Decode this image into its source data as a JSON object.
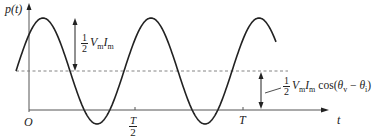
{
  "figure": {
    "y_axis_label": "p(t)",
    "x_axis_label": "t",
    "origin_label": "O",
    "ticks": [
      {
        "label_num": "T",
        "label_den": "2",
        "position": "half-period"
      },
      {
        "label": "T",
        "position": "period"
      }
    ],
    "amplitude_annotation": {
      "coefficient_num": "1",
      "coefficient_den": "2",
      "V": "V",
      "V_sub": "m",
      "I": "I",
      "I_sub": "m"
    },
    "average_annotation": {
      "coefficient_num": "1",
      "coefficient_den": "2",
      "V": "V",
      "V_sub": "m",
      "I": "I",
      "I_sub": "m",
      "func": "cos(",
      "theta_v": "θ",
      "theta_v_sub": "v",
      "minus": " − ",
      "theta_i": "θ",
      "theta_i_sub": "i",
      "close": ")"
    },
    "colors": {
      "curve": "#222222",
      "axes": "#555555",
      "dashed_line": "#777777"
    }
  }
}
